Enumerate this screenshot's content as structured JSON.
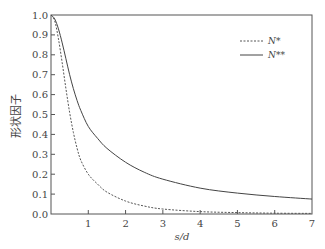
{
  "chart_data": {
    "type": "line",
    "title": "",
    "xlabel": "s/d",
    "ylabel": "形状因子",
    "xlim": [
      0,
      7
    ],
    "ylim": [
      0.0,
      1.0
    ],
    "xticks": [
      1,
      2,
      3,
      4,
      5,
      6,
      7
    ],
    "yticks": [
      0.0,
      0.1,
      0.2,
      0.3,
      0.4,
      0.5,
      0.6,
      0.7,
      0.8,
      0.9,
      1.0
    ],
    "ytick_labels": [
      "0.0",
      "0.1",
      "0.2",
      "0.3",
      "0.4",
      "0.5",
      "0.6",
      "0.7",
      "0.8",
      "0.9",
      "1.0"
    ],
    "xtick_labels": [
      "1",
      "2",
      "3",
      "4",
      "5",
      "6",
      "7"
    ],
    "grid": false,
    "legend_position": "upper right",
    "series": [
      {
        "name": "N*",
        "style": "dashed",
        "x": [
          0,
          0.1,
          0.2,
          0.3,
          0.4,
          0.5,
          0.6,
          0.7,
          0.8,
          1.0,
          1.25,
          1.5,
          2.0,
          2.5,
          3.0,
          4.0,
          5.0,
          6.0,
          7.0
        ],
        "y": [
          1.0,
          0.97,
          0.88,
          0.76,
          0.63,
          0.51,
          0.41,
          0.33,
          0.27,
          0.2,
          0.15,
          0.11,
          0.065,
          0.04,
          0.025,
          0.012,
          0.007,
          0.004,
          0.003
        ]
      },
      {
        "name": "N**",
        "style": "solid",
        "x": [
          0,
          0.1,
          0.2,
          0.3,
          0.4,
          0.5,
          0.6,
          0.7,
          0.8,
          1.0,
          1.25,
          1.5,
          2.0,
          2.5,
          3.0,
          4.0,
          5.0,
          6.0,
          7.0
        ],
        "y": [
          1.0,
          0.98,
          0.93,
          0.86,
          0.78,
          0.7,
          0.63,
          0.57,
          0.52,
          0.44,
          0.38,
          0.33,
          0.26,
          0.21,
          0.175,
          0.13,
          0.105,
          0.088,
          0.075
        ]
      }
    ]
  },
  "legend": {
    "items": [
      {
        "label": "N*",
        "style": "dashed"
      },
      {
        "label": "N**",
        "style": "solid"
      }
    ]
  }
}
